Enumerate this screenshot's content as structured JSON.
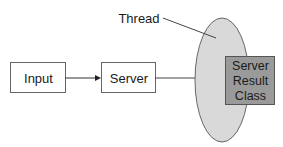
{
  "diagram": {
    "nodes": [
      {
        "id": "input",
        "label": "Input"
      },
      {
        "id": "server",
        "label": "Server"
      },
      {
        "id": "thread",
        "label": "Thread"
      },
      {
        "id": "server_result_class",
        "label_lines": [
          "Server",
          "Result",
          "Class"
        ]
      }
    ],
    "edges": [
      {
        "from": "input",
        "to": "server",
        "arrow": true
      },
      {
        "from": "server",
        "to": "thread",
        "arrow": false
      }
    ],
    "colors": {
      "box_fill": "#ffffff",
      "box_stroke": "#555555",
      "thread_fill": "#d9d9d9",
      "result_fill": "#9a9a9a",
      "text": "#1a1a1a"
    }
  }
}
